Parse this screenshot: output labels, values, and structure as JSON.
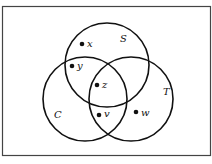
{
  "diagram": {
    "type": "venn",
    "sets": [
      {
        "name": "S",
        "label": "S"
      },
      {
        "name": "C",
        "label": "C"
      },
      {
        "name": "T",
        "label": "T"
      }
    ],
    "points": [
      {
        "label": "x",
        "region": "S only"
      },
      {
        "label": "y",
        "region": "S and C only"
      },
      {
        "label": "z",
        "region": "S and C and T"
      },
      {
        "label": "v",
        "region": "C and T only"
      },
      {
        "label": "w",
        "region": "T only"
      }
    ],
    "colors": {
      "stroke": "#111111",
      "background": "#ffffff",
      "frame": "#444444"
    }
  }
}
